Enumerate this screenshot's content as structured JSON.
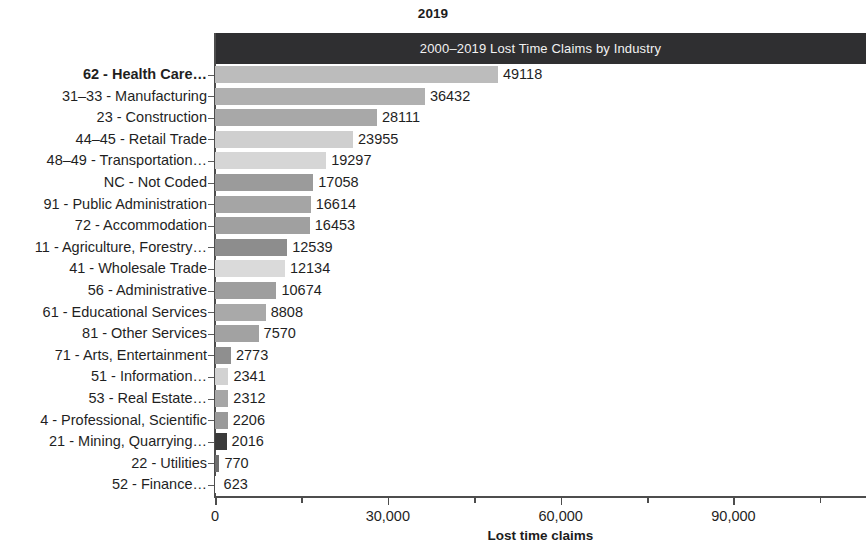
{
  "chart_title": "2019",
  "header_band": {
    "label": "2000–2019 Lost Time Claims by Industry",
    "background": "#2f2f31",
    "text_color": "#f2f2f2"
  },
  "axis": {
    "xlabel": "Lost time claims",
    "xticks": [
      "0",
      "30,000",
      "60,000",
      "90,000"
    ],
    "xtick_values": [
      0,
      30000,
      60000,
      90000
    ],
    "xminor_values": [
      15000,
      45000,
      75000,
      105000
    ],
    "xlim": [
      0,
      113000
    ]
  },
  "chart_data": {
    "type": "bar",
    "orientation": "horizontal",
    "title": "2019",
    "subtitle": "2000–2019 Lost Time Claims by Industry",
    "xlabel": "Lost time claims",
    "ylabel": "",
    "xlim": [
      0,
      113000
    ],
    "grid": false,
    "legend": null,
    "value_labels": true,
    "categories": [
      "62 - Health Care…",
      "31–33 - Manufacturing",
      "23 - Construction",
      "44–45 - Retail Trade",
      "48–49 - Transportation…",
      "NC - Not Coded",
      "91 - Public Administration",
      "72 - Accommodation",
      "11 - Agriculture, Forestry…",
      "41 - Wholesale Trade",
      "56 - Administrative",
      "61 - Educational Services",
      "81 - Other Services",
      "71 - Arts, Entertainment",
      "51 - Information…",
      "53 - Real Estate…",
      "4 - Professional, Scientific",
      "21 - Mining, Quarrying…",
      "22 - Utilities",
      "52 - Finance…"
    ],
    "values": [
      49118,
      36432,
      28111,
      23955,
      19297,
      17058,
      16614,
      16453,
      12539,
      12134,
      10674,
      8808,
      7570,
      2773,
      2341,
      2312,
      2206,
      2016,
      770,
      623
    ],
    "value_labels_text": [
      "49118",
      "36432",
      "28111",
      "23955",
      "19297",
      "17058",
      "16614",
      "16453",
      "12539",
      "12134",
      "10674",
      "8808",
      "7570",
      "2773",
      "2341",
      "2312",
      "2206",
      "2016",
      "770",
      "623"
    ],
    "bar_colors": [
      "#bcbcbc",
      "#b0b0b0",
      "#a8a8a8",
      "#cfcfcf",
      "#d6d6d6",
      "#9b9b9b",
      "#a5a5a5",
      "#a0a0a0",
      "#8d8d8d",
      "#dadada",
      "#9e9e9e",
      "#a9a9a9",
      "#a2a2a2",
      "#8f8f8f",
      "#d2d2d2",
      "#a6a6a6",
      "#9a9a9a",
      "#3a3a3a",
      "#6e6e6e",
      "#ffffff"
    ],
    "highlighted_category": "62 - Health Care…"
  }
}
